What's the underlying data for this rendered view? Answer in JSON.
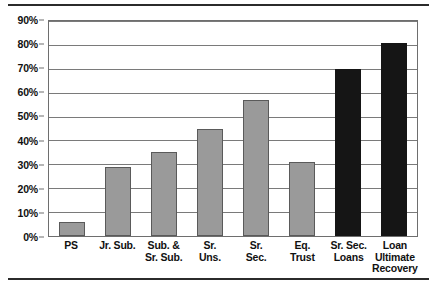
{
  "chart_data": {
    "type": "bar",
    "title": "",
    "subtitle": "",
    "xlabel": "",
    "ylabel": "",
    "ylim": [
      0,
      90
    ],
    "ytick_step": 10,
    "grid": true,
    "legend": "none",
    "orientation": "vertical",
    "categories": [
      "PS",
      "Jr. Sub.",
      "Sub. & Sr. Sub.",
      "Sr. Uns.",
      "Sr. Sec.",
      "Eq. Trust",
      "Sr. Sec. Loans",
      "Loan Ultimate Recovery"
    ],
    "category_lines": [
      [
        "PS"
      ],
      [
        "Jr. Sub."
      ],
      [
        "Sub. &",
        "Sr. Sub."
      ],
      [
        "Sr.",
        "Uns."
      ],
      [
        "Sr.",
        "Sec."
      ],
      [
        "Eq.",
        "Trust"
      ],
      [
        "Sr. Sec.",
        "Loans"
      ],
      [
        "Loan",
        "Ultimate",
        "Recovery"
      ]
    ],
    "values": [
      6,
      29,
      35,
      45,
      57,
      31,
      70,
      81
    ],
    "value_labels": [
      "6%",
      "29%",
      "35%",
      "45%",
      "57%",
      "31%",
      "70%",
      "81%"
    ],
    "bar_colors": [
      "#9a9a9a",
      "#9a9a9a",
      "#9a9a9a",
      "#9a9a9a",
      "#9a9a9a",
      "#9a9a9a",
      "#151515",
      "#151515"
    ],
    "ytick_labels": [
      "0%",
      "10%",
      "20%",
      "30%",
      "40%",
      "50%",
      "60%",
      "70%",
      "80%",
      "90%"
    ],
    "ytick_values": [
      0,
      10,
      20,
      30,
      40,
      50,
      60,
      70,
      80,
      90
    ]
  },
  "colors": {
    "bar_gray": "#9a9a9a",
    "bar_dark": "#151515",
    "gridline": "#7a7a7a",
    "frame": "#6e6e6e",
    "rule": "#2b2b2b",
    "text": "#111111",
    "background": "#ffffff"
  }
}
